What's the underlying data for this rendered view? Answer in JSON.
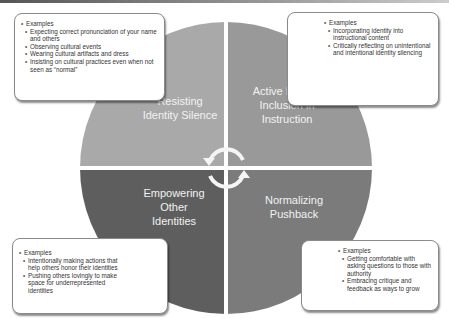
{
  "diagram": {
    "quadrants": [
      {
        "id": "top-left",
        "label_lines": [
          "Resisting",
          "Identity Silence"
        ],
        "color": "#a9a9a9"
      },
      {
        "id": "top-right",
        "label_lines": [
          "Active Identity",
          "Inclusion in",
          "Instruction"
        ],
        "color": "#999999"
      },
      {
        "id": "bottom-left",
        "label_lines": [
          "Empowering",
          "Other",
          "Identities"
        ],
        "color": "#5e5e5e"
      },
      {
        "id": "bottom-right",
        "label_lines": [
          "Normalizing",
          "Pushback"
        ],
        "color": "#7b7b7b"
      }
    ],
    "center_icon": "cycle-arrows-icon",
    "boxes": {
      "top_left": {
        "heading": "Examples",
        "items": [
          "Expecting correct pronunciation of your name and others",
          "Observing cultural events",
          "Wearing cultural artifacts and dress",
          "Insisting on cultural practices even when not seen as “normal”"
        ]
      },
      "top_right": {
        "heading": "Examples",
        "items": [
          "Incorporating identity into instructional content",
          "Critically reflecting on unintentional and intentional identity silencing"
        ]
      },
      "bottom_left": {
        "heading": "Examples",
        "items": [
          "Intentionally making actions that help others honor their identities",
          "Pushing others lovingly to make space for underrepresented identities"
        ]
      },
      "bottom_right": {
        "heading": "Examples",
        "items": [
          "Getting comfortable with asking questions to those with authority",
          "Embracing critique and feedback as ways to grow"
        ]
      }
    }
  }
}
